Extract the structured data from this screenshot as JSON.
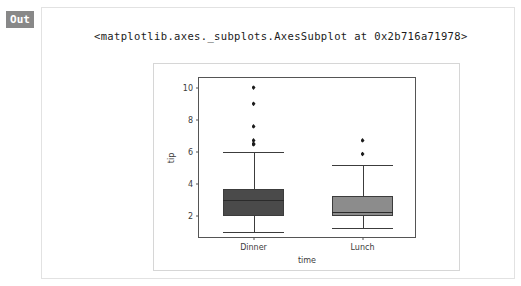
{
  "cell": {
    "badge_label": "Out",
    "repr_text": "<matplotlib.axes._subplots.AxesSubplot at 0x2b716a71978>"
  },
  "chart_data": {
    "type": "box",
    "title": "",
    "xlabel": "time",
    "ylabel": "tip",
    "categories": [
      "Dinner",
      "Lunch"
    ],
    "ylim": [
      0.55,
      10.6
    ],
    "yticks": [
      2,
      4,
      6,
      8,
      10
    ],
    "ytick_labels": [
      "2",
      "4",
      "6",
      "8",
      "10"
    ],
    "grid": false,
    "legend": false,
    "box_colors": [
      "#4a4a4a",
      "#8c8c8c"
    ],
    "edge_color": "#3c3c3c",
    "boxes": [
      {
        "name": "Dinner",
        "color": "#4a4a4a",
        "whisker_low": 1.0,
        "q1": 2.0,
        "median": 3.0,
        "q3": 3.68,
        "whisker_high": 6.0,
        "fliers": [
          6.45,
          6.5,
          6.7,
          7.58,
          9.0,
          10.0
        ]
      },
      {
        "name": "Lunch",
        "color": "#8c8c8c",
        "whisker_low": 1.25,
        "q1": 1.96,
        "median": 2.25,
        "q3": 3.25,
        "whisker_high": 5.17,
        "fliers": [
          5.85,
          6.7
        ]
      }
    ]
  }
}
